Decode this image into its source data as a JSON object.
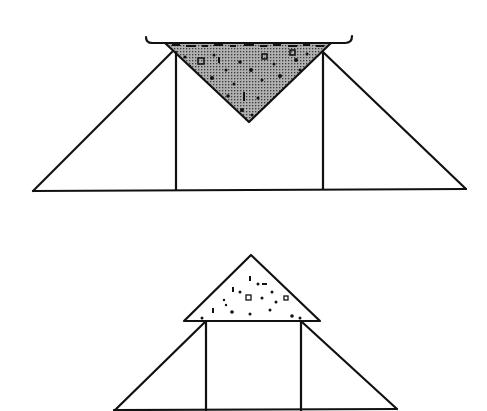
{
  "diagram": {
    "colors": {
      "stroke": "#111111",
      "dark_fill": "#9a9a9a",
      "light_fill": "#ffffff",
      "speckle": "#111111",
      "background": "#ffffff"
    },
    "figures": [
      {
        "id": "top",
        "label": "inverted-triangle-load-on-embankment",
        "base": [
          [
            33,
            191
          ],
          [
            466,
            189
          ]
        ],
        "left_slope": [
          [
            33,
            191
          ],
          [
            172,
            52
          ]
        ],
        "right_slope": [
          [
            323,
            52
          ],
          [
            466,
            189
          ]
        ],
        "verticals": [
          [
            [
              176,
              52
            ],
            [
              176,
              190
            ]
          ],
          [
            [
              323,
              52
            ],
            [
              323,
              189
            ]
          ]
        ],
        "load_triangle": [
          [
            165,
            43
          ],
          [
            331,
            43
          ],
          [
            249,
            122
          ]
        ],
        "load_fill": "dark",
        "hooks": [
          [
            145,
            43
          ],
          [
            355,
            43
          ]
        ]
      },
      {
        "id": "bottom",
        "label": "upright-triangle-load-on-embankment",
        "base": [
          [
            114,
            411
          ],
          [
            397,
            409
          ]
        ],
        "left_slope": [
          [
            114,
            411
          ],
          [
            205,
            322
          ]
        ],
        "right_slope": [
          [
            302,
            322
          ],
          [
            397,
            409
          ]
        ],
        "verticals": [
          [
            [
              206,
              322
            ],
            [
              206,
              411
            ]
          ],
          [
            [
              301,
              322
            ],
            [
              301,
              411
            ]
          ]
        ],
        "load_triangle": [
          [
            184,
            321
          ],
          [
            251,
            255
          ],
          [
            320,
            321
          ]
        ],
        "load_fill": "light"
      }
    ]
  }
}
